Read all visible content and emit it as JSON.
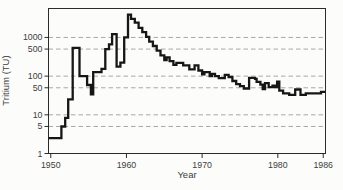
{
  "figure": {
    "background": "#fcfcfa",
    "line_color": "#161616",
    "grid_color": "#9e9e9e",
    "frame_color": "#2b2b2b",
    "text_color": "#3d3d3d"
  },
  "chart_data": {
    "type": "line",
    "style": "step",
    "title": "",
    "xlabel": "Year",
    "ylabel": "Tritium (TU)",
    "y_scale": "log",
    "grid": "dashed-horizontal",
    "xlim": [
      1949.7,
      1986.3
    ],
    "ylim": [
      1,
      5600
    ],
    "x_ticks": [
      1950,
      1960,
      1970,
      1980,
      1986
    ],
    "y_ticks": [
      1,
      5,
      10,
      50,
      100,
      500,
      1000
    ],
    "y_gridlines": [
      5,
      10,
      50,
      100,
      500,
      1000
    ],
    "series": [
      {
        "name": "tritium-in-precipitation",
        "step_points": [
          [
            1949.7,
            2.5
          ],
          [
            1951.4,
            5
          ],
          [
            1951.9,
            8.3
          ],
          [
            1952.3,
            25
          ],
          [
            1952.9,
            540
          ],
          [
            1953.8,
            100
          ],
          [
            1954.8,
            59
          ],
          [
            1955.3,
            34
          ],
          [
            1955.6,
            127
          ],
          [
            1956.7,
            155
          ],
          [
            1957.2,
            500
          ],
          [
            1957.7,
            665
          ],
          [
            1958.1,
            1210
          ],
          [
            1958.7,
            175
          ],
          [
            1959.2,
            222
          ],
          [
            1959.7,
            1000
          ],
          [
            1960.2,
            3880
          ],
          [
            1960.6,
            3040
          ],
          [
            1961.1,
            2400
          ],
          [
            1961.6,
            1780
          ],
          [
            1962.1,
            1370
          ],
          [
            1962.6,
            1040
          ],
          [
            1963.0,
            780
          ],
          [
            1963.5,
            600
          ],
          [
            1964.0,
            455
          ],
          [
            1964.5,
            345
          ],
          [
            1965.0,
            260
          ],
          [
            1965.3,
            305
          ],
          [
            1965.7,
            245
          ],
          [
            1966.2,
            195
          ],
          [
            1966.6,
            220
          ],
          [
            1967.5,
            190
          ],
          [
            1968.3,
            150
          ],
          [
            1969.0,
            190
          ],
          [
            1969.5,
            140
          ],
          [
            1970.0,
            111
          ],
          [
            1970.3,
            127
          ],
          [
            1971.0,
            100
          ],
          [
            1971.3,
            115
          ],
          [
            1971.7,
            100
          ],
          [
            1972.2,
            89
          ],
          [
            1973.0,
            108
          ],
          [
            1973.5,
            95
          ],
          [
            1974.0,
            75
          ],
          [
            1974.5,
            62
          ],
          [
            1975.0,
            55
          ],
          [
            1975.5,
            48
          ],
          [
            1976.2,
            90
          ],
          [
            1977.0,
            85
          ],
          [
            1977.2,
            71
          ],
          [
            1977.7,
            60
          ],
          [
            1978.0,
            46
          ],
          [
            1978.3,
            66
          ],
          [
            1978.8,
            52
          ],
          [
            1979.3,
            57
          ],
          [
            1979.6,
            52
          ],
          [
            1979.9,
            72
          ],
          [
            1980.2,
            42
          ],
          [
            1980.7,
            36
          ],
          [
            1981.5,
            33
          ],
          [
            1982.3,
            45
          ],
          [
            1983.0,
            33
          ],
          [
            1983.7,
            36
          ],
          [
            1985.7,
            39
          ]
        ],
        "end_x": 1986.3
      }
    ]
  }
}
